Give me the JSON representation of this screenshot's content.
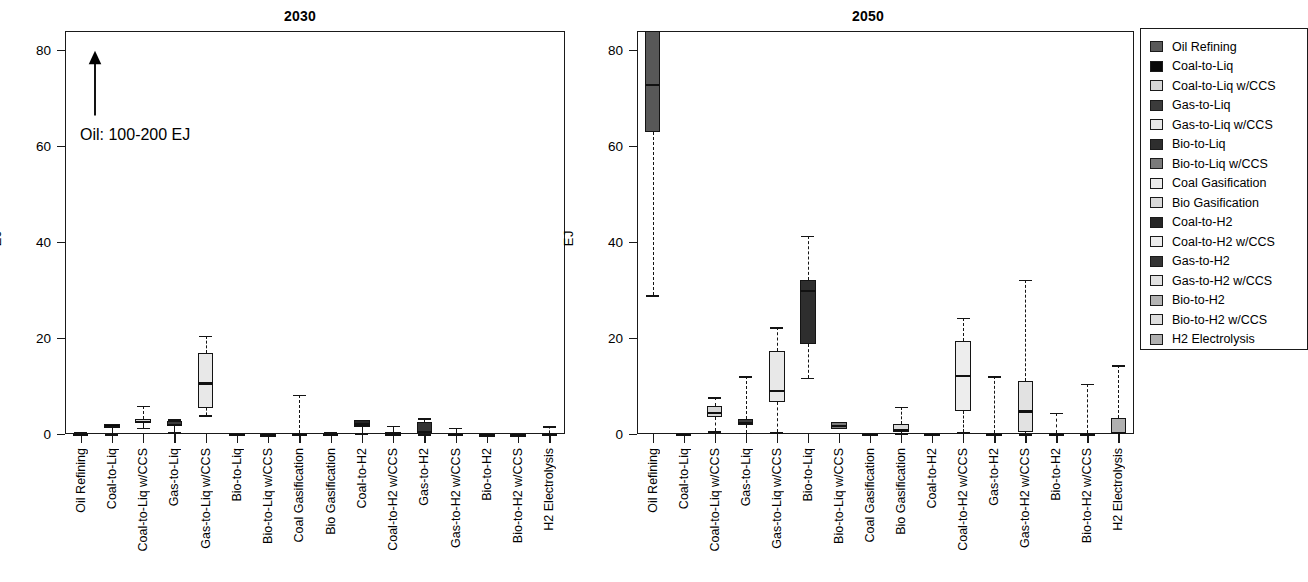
{
  "figure": {
    "ylabel": "EJ",
    "annotation": "Oil: 100-200 EJ",
    "annotation_icon": "up-arrow-icon"
  },
  "axis": {
    "y_ticks": [
      "0",
      "20",
      "40",
      "60",
      "80"
    ],
    "y_values": [
      0,
      20,
      40,
      60,
      80
    ],
    "ymin": 0,
    "ymax": 84
  },
  "categories": [
    "Oil Refining",
    "Coal-to-Liq",
    "Coal-to-Liq w/CCS",
    "Gas-to-Liq",
    "Gas-to-Liq w/CCS",
    "Bio-to-Liq",
    "Bio-to-Liq w/CCS",
    "Coal Gasification",
    "Bio Gasification",
    "Coal-to-H2",
    "Coal-to-H2 w/CCS",
    "Gas-to-H2",
    "Gas-to-H2 w/CCS",
    "Bio-to-H2",
    "Bio-to-H2 w/CCS",
    "H2 Electrolysis"
  ],
  "legend": {
    "items": [
      {
        "label": "Oil Refining",
        "color": "#585858"
      },
      {
        "label": "Coal-to-Liq",
        "color": "#080808"
      },
      {
        "label": "Coal-to-Liq w/CCS",
        "color": "#d6d6d6"
      },
      {
        "label": "Gas-to-Liq",
        "color": "#3b3b3b"
      },
      {
        "label": "Gas-to-Liq w/CCS",
        "color": "#e8e8e8"
      },
      {
        "label": "Bio-to-Liq",
        "color": "#2e2e2e"
      },
      {
        "label": "Bio-to-Liq w/CCS",
        "color": "#7a7a7a"
      },
      {
        "label": "Coal Gasification",
        "color": "#ececec"
      },
      {
        "label": "Bio Gasification",
        "color": "#dadada"
      },
      {
        "label": "Coal-to-H2",
        "color": "#262626"
      },
      {
        "label": "Coal-to-H2 w/CCS",
        "color": "#ededed"
      },
      {
        "label": "Gas-to-H2",
        "color": "#343434"
      },
      {
        "label": "Gas-to-H2 w/CCS",
        "color": "#e2e2e2"
      },
      {
        "label": "Bio-to-H2",
        "color": "#b4b4b4"
      },
      {
        "label": "Bio-to-H2 w/CCS",
        "color": "#dedede"
      },
      {
        "label": "H2 Electrolysis",
        "color": "#b0b0b0"
      }
    ]
  },
  "chart_data": [
    {
      "type": "boxplot",
      "title": "2030",
      "xlabel": "",
      "ylabel": "EJ",
      "ylim": [
        0,
        84
      ],
      "grid": false,
      "note": "Oil Refining box is off-scale (100-200 EJ), indicated by arrow annotation",
      "categories": [
        "Oil Refining",
        "Coal-to-Liq",
        "Coal-to-Liq w/CCS",
        "Gas-to-Liq",
        "Gas-to-Liq w/CCS",
        "Bio-to-Liq",
        "Bio-to-Liq w/CCS",
        "Coal Gasification",
        "Bio Gasification",
        "Coal-to-H2",
        "Coal-to-H2 w/CCS",
        "Gas-to-H2",
        "Gas-to-H2 w/CCS",
        "Bio-to-H2",
        "Bio-to-H2 w/CCS",
        "H2 Electrolysis"
      ],
      "boxes": [
        {
          "cat": "Oil Refining",
          "low": 0.0,
          "q1": 0.0,
          "med": 0.0,
          "q3": 0.3,
          "high": 0.5,
          "color": "#585858"
        },
        {
          "cat": "Coal-to-Liq",
          "low": 0.0,
          "q1": 1.2,
          "med": 1.7,
          "q3": 2.1,
          "high": 2.1,
          "color": "#080808"
        },
        {
          "cat": "Coal-to-Liq w/CCS",
          "low": 1.3,
          "q1": 2.3,
          "med": 2.8,
          "q3": 3.2,
          "high": 5.9,
          "color": "#d6d6d6"
        },
        {
          "cat": "Gas-to-Liq",
          "low": 0.4,
          "q1": 1.7,
          "med": 2.1,
          "q3": 2.7,
          "high": 3.1,
          "color": "#3b3b3b"
        },
        {
          "cat": "Gas-to-Liq w/CCS",
          "low": 3.9,
          "q1": 5.5,
          "med": 10.8,
          "q3": 16.8,
          "high": 20.5,
          "color": "#e8e8e8"
        },
        {
          "cat": "Bio-to-Liq",
          "low": 0.0,
          "q1": 0.0,
          "med": 0.1,
          "q3": 0.2,
          "high": 0.3,
          "color": "#2e2e2e"
        },
        {
          "cat": "Bio-to-Liq w/CCS",
          "low": 0.0,
          "q1": 0.0,
          "med": 0.0,
          "q3": 0.1,
          "high": 0.2,
          "color": "#7a7a7a"
        },
        {
          "cat": "Coal Gasification",
          "low": 0.0,
          "q1": 0.0,
          "med": 0.0,
          "q3": 0.2,
          "high": 8.2,
          "color": "#ececec"
        },
        {
          "cat": "Bio Gasification",
          "low": 0.0,
          "q1": 0.0,
          "med": 0.1,
          "q3": 0.3,
          "high": 0.4,
          "color": "#dadada"
        },
        {
          "cat": "Coal-to-H2",
          "low": 0.2,
          "q1": 1.4,
          "med": 2.2,
          "q3": 3.0,
          "high": 3.0,
          "color": "#262626"
        },
        {
          "cat": "Coal-to-H2 w/CCS",
          "low": 0.0,
          "q1": 0.0,
          "med": 0.1,
          "q3": 0.4,
          "high": 1.7,
          "color": "#ededed"
        },
        {
          "cat": "Gas-to-H2",
          "low": 0.0,
          "q1": 0.2,
          "med": 0.4,
          "q3": 2.4,
          "high": 3.3,
          "color": "#343434"
        },
        {
          "cat": "Gas-to-H2 w/CCS",
          "low": 0.0,
          "q1": 0.0,
          "med": 0.1,
          "q3": 0.3,
          "high": 1.3,
          "color": "#e2e2e2"
        },
        {
          "cat": "Bio-to-H2",
          "low": 0.0,
          "q1": 0.0,
          "med": 0.0,
          "q3": 0.1,
          "high": 0.2,
          "color": "#b4b4b4"
        },
        {
          "cat": "Bio-to-H2 w/CCS",
          "low": 0.0,
          "q1": 0.0,
          "med": 0.0,
          "q3": 0.1,
          "high": 0.2,
          "color": "#dedede"
        },
        {
          "cat": "H2 Electrolysis",
          "low": 0.0,
          "q1": 0.0,
          "med": 0.1,
          "q3": 0.3,
          "high": 1.6,
          "color": "#b0b0b0"
        }
      ]
    },
    {
      "type": "boxplot",
      "title": "2050",
      "xlabel": "",
      "ylabel": "EJ",
      "ylim": [
        0,
        84
      ],
      "grid": false,
      "note": "Oil Refining upper quartile extends above plotted range",
      "categories": [
        "Oil Refining",
        "Coal-to-Liq",
        "Coal-to-Liq w/CCS",
        "Gas-to-Liq",
        "Gas-to-Liq w/CCS",
        "Bio-to-Liq",
        "Bio-to-Liq w/CCS",
        "Coal Gasification",
        "Bio Gasification",
        "Coal-to-H2",
        "Coal-to-H2 w/CCS",
        "Gas-to-H2",
        "Gas-to-H2 w/CCS",
        "Bio-to-H2",
        "Bio-to-H2 w/CCS",
        "H2 Electrolysis"
      ],
      "boxes": [
        {
          "cat": "Oil Refining",
          "low": 28.9,
          "q1": 63.0,
          "med": 73.0,
          "q3": 88.0,
          "high": 88.0,
          "color": "#585858"
        },
        {
          "cat": "Coal-to-Liq",
          "low": 0.0,
          "q1": 0.0,
          "med": 0.0,
          "q3": 0.2,
          "high": 0.3,
          "color": "#080808"
        },
        {
          "cat": "Coal-to-Liq w/CCS",
          "low": 0.6,
          "q1": 3.6,
          "med": 4.6,
          "q3": 5.9,
          "high": 7.7,
          "color": "#d6d6d6"
        },
        {
          "cat": "Gas-to-Liq",
          "low": 0.3,
          "q1": 1.8,
          "med": 2.5,
          "q3": 3.2,
          "high": 12.0,
          "color": "#3b3b3b"
        },
        {
          "cat": "Gas-to-Liq w/CCS",
          "low": 0.4,
          "q1": 6.6,
          "med": 9.2,
          "q3": 17.3,
          "high": 22.2,
          "color": "#e8e8e8"
        },
        {
          "cat": "Bio-to-Liq",
          "low": 11.7,
          "q1": 18.8,
          "med": 30.0,
          "q3": 32.0,
          "high": 41.3,
          "color": "#2e2e2e"
        },
        {
          "cat": "Bio-to-Liq w/CCS",
          "low": 1.0,
          "q1": 1.0,
          "med": 1.9,
          "q3": 2.5,
          "high": 2.5,
          "color": "#7a7a7a"
        },
        {
          "cat": "Coal Gasification",
          "low": 0.0,
          "q1": 0.0,
          "med": 0.0,
          "q3": 0.2,
          "high": 0.3,
          "color": "#ececec"
        },
        {
          "cat": "Bio Gasification",
          "low": 0.2,
          "q1": 0.5,
          "med": 1.1,
          "q3": 2.0,
          "high": 5.7,
          "color": "#dadada"
        },
        {
          "cat": "Coal-to-H2",
          "low": 0.0,
          "q1": 0.0,
          "med": 0.0,
          "q3": 0.2,
          "high": 0.3,
          "color": "#262626"
        },
        {
          "cat": "Coal-to-H2 w/CCS",
          "low": 0.4,
          "q1": 4.7,
          "med": 12.4,
          "q3": 19.3,
          "high": 24.2,
          "color": "#ededed"
        },
        {
          "cat": "Gas-to-H2",
          "low": 0.0,
          "q1": 0.0,
          "med": 0.1,
          "q3": 0.3,
          "high": 12.0,
          "color": "#343434"
        },
        {
          "cat": "Gas-to-H2 w/CCS",
          "low": 0.0,
          "q1": 0.5,
          "med": 4.9,
          "q3": 11.0,
          "high": 32.2,
          "color": "#e2e2e2"
        },
        {
          "cat": "Bio-to-H2",
          "low": 0.0,
          "q1": 0.0,
          "med": 0.1,
          "q3": 0.3,
          "high": 4.4,
          "color": "#b4b4b4"
        },
        {
          "cat": "Bio-to-H2 w/CCS",
          "low": 0.0,
          "q1": 0.0,
          "med": 0.1,
          "q3": 0.3,
          "high": 10.5,
          "color": "#dedede"
        },
        {
          "cat": "H2 Electrolysis",
          "low": 0.0,
          "q1": 0.0,
          "med": 0.2,
          "q3": 3.3,
          "high": 14.3,
          "color": "#b0b0b0"
        }
      ]
    }
  ]
}
